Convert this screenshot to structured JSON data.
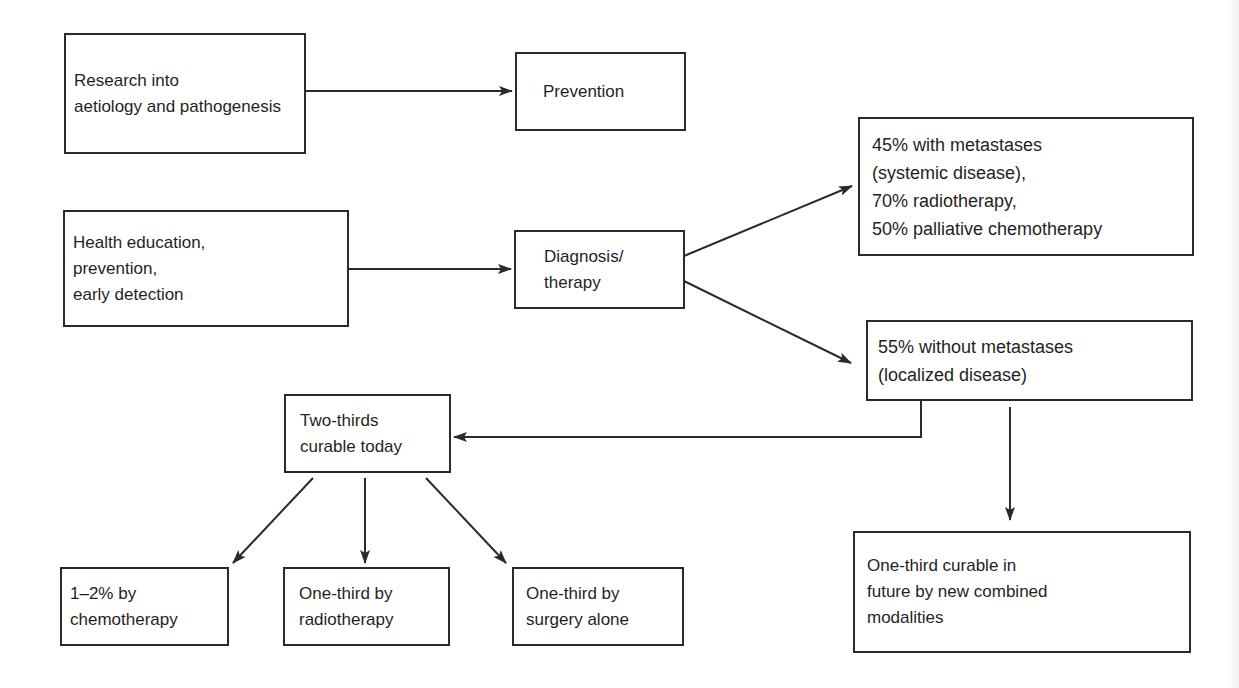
{
  "diagram": {
    "nodes": {
      "research": {
        "label": "Research into\naetiology and pathogenesis"
      },
      "prevention": {
        "label": "Prevention"
      },
      "health": {
        "label": "Health education,\nprevention,\nearly detection"
      },
      "diagnosis": {
        "label": "Diagnosis/\ntherapy"
      },
      "metastases": {
        "label": "45% with metastases\n(systemic disease),\n70% radiotherapy,\n50% palliative chemotherapy"
      },
      "localized": {
        "label": "55% without metastases\n(localized disease)"
      },
      "two_thirds": {
        "label": "Two-thirds\ncurable today"
      },
      "future": {
        "label": "One-third curable in\nfuture by new combined\nmodalities"
      },
      "chemo": {
        "label": "1–2% by\nchemotherapy"
      },
      "radio": {
        "label": "One-third by\nradiotherapy"
      },
      "surgery": {
        "label": "One-third by\nsurgery alone"
      }
    },
    "edges": [
      {
        "from": "research",
        "to": "prevention"
      },
      {
        "from": "health",
        "to": "diagnosis"
      },
      {
        "from": "diagnosis",
        "to": "metastases"
      },
      {
        "from": "diagnosis",
        "to": "localized"
      },
      {
        "from": "localized",
        "to": "two_thirds"
      },
      {
        "from": "localized",
        "to": "future"
      },
      {
        "from": "two_thirds",
        "to": "chemo"
      },
      {
        "from": "two_thirds",
        "to": "radio"
      },
      {
        "from": "two_thirds",
        "to": "surgery"
      }
    ],
    "colors": {
      "line": "#2a2a2a",
      "background": "#ffffff"
    }
  }
}
